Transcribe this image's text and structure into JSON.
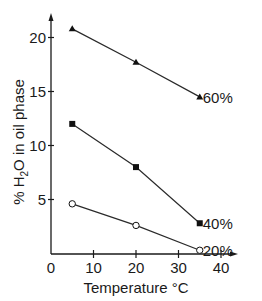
{
  "chart_data": {
    "type": "line",
    "title": "",
    "xlabel": "Temperature °C",
    "ylabel": "% H2O in oil phase",
    "xlim": [
      0,
      45
    ],
    "ylim": [
      0,
      22.5
    ],
    "xticks": [
      0,
      10,
      20,
      30,
      40
    ],
    "yticks": [
      5,
      10,
      15,
      20
    ],
    "grid": false,
    "legend": "inline labels at series end",
    "x": [
      5,
      20,
      35
    ],
    "series": [
      {
        "name": "60%",
        "marker": "filled-triangle",
        "values": [
          20.8,
          17.7,
          14.5
        ]
      },
      {
        "name": "40%",
        "marker": "filled-square",
        "values": [
          12.0,
          8.0,
          2.8
        ]
      },
      {
        "name": "20%",
        "marker": "open-circle",
        "values": [
          4.6,
          2.6,
          0.3
        ]
      }
    ]
  },
  "axes": {
    "x_label_main": "Temperature ",
    "x_label_unit": "°C",
    "y_label_prefix": "% H",
    "y_label_sub": "2",
    "y_label_suffix": "O in oil phase",
    "x_tick_labels": [
      "0",
      "10",
      "20",
      "30",
      "40"
    ],
    "y_tick_labels": [
      "5",
      "10",
      "15",
      "20"
    ]
  },
  "colors": {
    "line": "#2a2a2a",
    "text": "#1a1a1a",
    "background": "#ffffff"
  }
}
